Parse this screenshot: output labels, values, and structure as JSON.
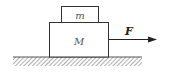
{
  "diagram": {
    "small_block": {
      "label": "m"
    },
    "large_block": {
      "label": "M"
    },
    "force": {
      "label": "F"
    },
    "colors": {
      "stroke": "#333333",
      "ground": "#888888"
    }
  }
}
